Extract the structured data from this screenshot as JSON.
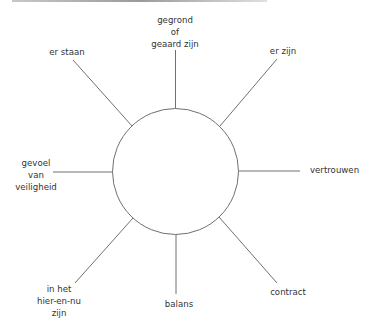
{
  "diagram": {
    "type": "radial-mindmap",
    "center": {
      "x": 175.5,
      "y": 171.5,
      "r": 63
    },
    "colors": {
      "line": "#707070",
      "text": "#333333",
      "background": "#ffffff"
    },
    "spokes": [
      {
        "id": "top",
        "lines": [
          "gegrond",
          "of",
          "geaard zijn"
        ]
      },
      {
        "id": "top-right",
        "lines": [
          "er zijn"
        ]
      },
      {
        "id": "right",
        "lines": [
          "vertrouwen"
        ]
      },
      {
        "id": "bottom-right",
        "lines": [
          "contract"
        ]
      },
      {
        "id": "bottom",
        "lines": [
          "balans"
        ]
      },
      {
        "id": "bottom-left",
        "lines": [
          "in het",
          "hier-en-nu",
          "zijn"
        ]
      },
      {
        "id": "left",
        "lines": [
          "gevoel",
          "van",
          "veiligheid"
        ]
      },
      {
        "id": "top-left",
        "lines": [
          "er staan"
        ]
      }
    ]
  }
}
